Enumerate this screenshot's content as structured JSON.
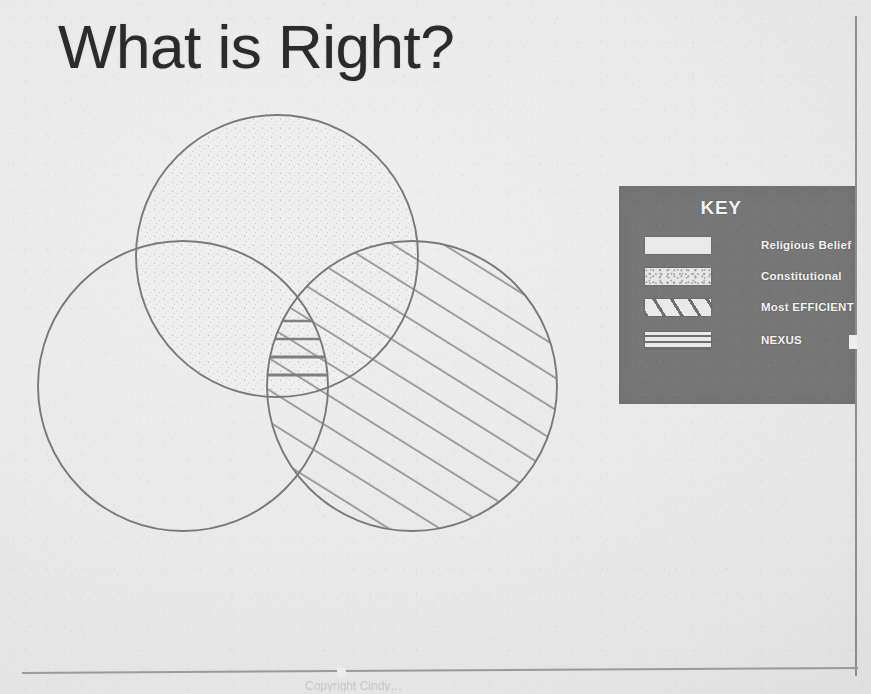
{
  "slide": {
    "title": "What is Right?",
    "background_color": "#e9e9e9",
    "width": 871,
    "height": 694
  },
  "key_panel": {
    "title": "KEY",
    "panel_color": "#777777",
    "text_color": "#f3f3f3",
    "entries": [
      {
        "label": "Religious Belief",
        "pattern": "solid-light",
        "swatch_icon": "swatch-plain-icon"
      },
      {
        "label": "Constitutional",
        "pattern": "speckled",
        "swatch_icon": "swatch-speckle-icon"
      },
      {
        "label": "Most EFFICIENT",
        "pattern": "diagonal-hatch",
        "swatch_icon": "swatch-diagonal-icon"
      },
      {
        "label": "NEXUS",
        "pattern": "horizontal-lines",
        "swatch_icon": "swatch-horizontal-icon"
      }
    ]
  },
  "venn": {
    "stroke_color": "#7a7a7a",
    "hatch_color": "#8a8a8a",
    "circles": [
      {
        "id": "religious-belief",
        "fill_pattern": "speckled",
        "cx": 277,
        "cy": 256,
        "r": 141
      },
      {
        "id": "constitutional",
        "fill_pattern": "none",
        "cx": 183,
        "cy": 386,
        "r": 145
      },
      {
        "id": "most-efficient",
        "fill_pattern": "diagonal-hatch",
        "cx": 412,
        "cy": 386,
        "r": 145
      }
    ],
    "center_intersection": {
      "id": "nexus",
      "fill_pattern": "horizontal-lines",
      "line_count": 4
    }
  },
  "caption": {
    "ghost_text": "Copyright Cindy…"
  }
}
